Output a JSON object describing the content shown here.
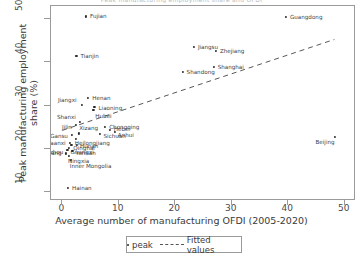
{
  "figure": {
    "title_clipped": "Peak manufacturing employment share and OFDI",
    "background": "#ffffff"
  },
  "legend": {
    "peak_label": "peak",
    "fitted_label": "Fitted values",
    "position": "below-axis-center"
  },
  "chart_data": {
    "type": "scatter",
    "title": "",
    "xlabel": "Average number of manufacturing OFDI  (2005-2020)",
    "ylabel": "Peak manufacturing employment share (%)",
    "xlim": [
      -2,
      52
    ],
    "ylim": [
      8,
      53
    ],
    "xticks": [
      0,
      10,
      20,
      30,
      40,
      50
    ],
    "yticks": [
      10,
      20,
      30,
      40,
      50
    ],
    "grid": false,
    "marker_color": "#2b2b2b",
    "fitted_line_color": "#555555",
    "fitted_line_style": "dashed",
    "series": [
      {
        "name": "peak",
        "points": [
          {
            "label": "Fujian",
            "x": 4.2,
            "y": 50.6,
            "lx": 4,
            "ly": 0
          },
          {
            "label": "Guangdong",
            "x": 39.6,
            "y": 50.4,
            "lx": 4,
            "ly": 0
          },
          {
            "label": "Jiangsu",
            "x": 23.3,
            "y": 43.6,
            "lx": 4,
            "ly": 0
          },
          {
            "label": "Zhejiang",
            "x": 27.2,
            "y": 42.7,
            "lx": 4,
            "ly": 0
          },
          {
            "label": "Tianjin",
            "x": 2.5,
            "y": 41.5,
            "lx": 4,
            "ly": 0
          },
          {
            "label": "Shanghai",
            "x": 26.8,
            "y": 38.9,
            "lx": 4,
            "ly": 0
          },
          {
            "label": "Shandong",
            "x": 21.3,
            "y": 37.8,
            "lx": 4,
            "ly": 0
          },
          {
            "label": "Henan",
            "x": 4.6,
            "y": 31.8,
            "lx": 4,
            "ly": 0
          },
          {
            "label": "Jiangxi",
            "x": 3.4,
            "y": 30.1,
            "lx": -3,
            "ly": -5,
            "anchor": "end"
          },
          {
            "label": "Liaoning",
            "x": 5.7,
            "y": 29.8,
            "lx": 4,
            "ly": 1
          },
          {
            "label": "Hubei",
            "x": 5.5,
            "y": 29.0,
            "lx": 2,
            "ly": 6
          },
          {
            "label": "Shanxi",
            "x": 3.1,
            "y": 26.3,
            "lx": -2,
            "ly": -5,
            "anchor": "end"
          },
          {
            "label": "Jilin",
            "x": 2.4,
            "y": 25.6,
            "lx": -2,
            "ly": 2,
            "anchor": "end"
          },
          {
            "label": "Chongqing",
            "x": 7.6,
            "y": 25.1,
            "lx": 4,
            "ly": 0
          },
          {
            "label": "Hebei",
            "x": 8.4,
            "y": 24.4,
            "lx": 4,
            "ly": -1
          },
          {
            "label": "Anhui",
            "x": 9.3,
            "y": 23.9,
            "lx": 3,
            "ly": 3
          },
          {
            "label": "Sichuan",
            "x": 6.6,
            "y": 23.5,
            "lx": 4,
            "ly": 2
          },
          {
            "label": "Xizang",
            "x": 3.0,
            "y": 23.6,
            "lx": 0,
            "ly": -5
          },
          {
            "label": "Gansu",
            "x": 1.7,
            "y": 23.2,
            "lx": -2,
            "ly": 1,
            "anchor": "end"
          },
          {
            "label": "Heilongjiang",
            "x": 2.4,
            "y": 22.3,
            "lx": -1,
            "ly": 4
          },
          {
            "label": "Shaanxi",
            "x": 1.3,
            "y": 21.4,
            "lx": -2,
            "ly": 0,
            "anchor": "end"
          },
          {
            "label": "Qinghai",
            "x": 1.6,
            "y": 21.0,
            "lx": 2,
            "ly": 3
          },
          {
            "label": "Hunan",
            "x": 2.6,
            "y": 20.9,
            "lx": 3,
            "ly": 1
          },
          {
            "label": "Guangxi",
            "x": 1.1,
            "y": 20.2,
            "lx": 2,
            "ly": 4
          },
          {
            "label": "Guizhou",
            "x": 0.9,
            "y": 19.7,
            "lx": -2,
            "ly": 2,
            "anchor": "end"
          },
          {
            "label": "Yunnan",
            "x": 1.8,
            "y": 19.5,
            "lx": 3,
            "ly": 2
          },
          {
            "label": "Xinjiang",
            "x": 0.6,
            "y": 19.0,
            "lx": -2,
            "ly": 0,
            "anchor": "end"
          },
          {
            "label": "Ningxia",
            "x": 1.2,
            "y": 18.4,
            "lx": -1,
            "ly": 5
          },
          {
            "label": "Inner Mongolia",
            "x": 1.5,
            "y": 17.4,
            "lx": -1,
            "ly": 6
          },
          {
            "label": "Beijing",
            "x": 48.2,
            "y": 22.8,
            "lx": 2,
            "ly": 5,
            "anchor": "end"
          },
          {
            "label": "Hainan",
            "x": 1.0,
            "y": 11.1,
            "lx": 4,
            "ly": 0
          }
        ]
      }
    ],
    "fitted_values": {
      "name": "Fitted values",
      "x_start": 0.0,
      "y_start": 24.0,
      "x_end": 48.5,
      "y_end": 45.2
    }
  },
  "axes": {
    "x_tick_labels": [
      "0",
      "10",
      "20",
      "30",
      "40",
      "50"
    ],
    "y_tick_labels": [
      "10",
      "20",
      "30",
      "40",
      "50"
    ]
  }
}
